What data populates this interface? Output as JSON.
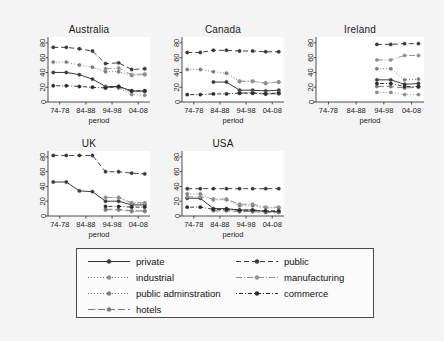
{
  "figure": {
    "background_color": "#f4f4f4",
    "panel_background": "#ffffff",
    "axis_color": "#3a3a3a",
    "xlabel": "period",
    "x_categories": [
      "74-78",
      "84-88",
      "94-98",
      "04-08"
    ],
    "x_tick_positions": [
      1.5,
      3.5,
      5.5,
      7.5
    ],
    "n_x_points": 8,
    "ylim": [
      0,
      88
    ],
    "y_ticks": [
      0,
      20,
      40,
      60,
      80
    ],
    "grid": false,
    "legend_position": "bottom-center"
  },
  "series_styles": [
    {
      "name": "private",
      "dash": "none",
      "color": "#2f2f2f",
      "marker_color": "#3d3d3d"
    },
    {
      "name": "industrial",
      "dash": "dotted",
      "color": "#8a8a8a",
      "marker_color": "#8a8a8a"
    },
    {
      "name": "public adminstration",
      "dash": "dashdot",
      "color": "#7d7d7d",
      "marker_color": "#7d7d7d"
    },
    {
      "name": "hotels",
      "dash": "longdash",
      "color": "#7a7a7a",
      "marker_color": "#7a7a7a"
    },
    {
      "name": "public",
      "dash": "dashed",
      "color": "#3a3a3a",
      "marker_color": "#3a3a3a"
    },
    {
      "name": "manufacturing",
      "dash": "dashdotdot",
      "color": "#909090",
      "marker_color": "#909090"
    },
    {
      "name": "commerce",
      "dash": "dashdotsp",
      "color": "#2b2b2b",
      "marker_color": "#2b2b2b"
    }
  ],
  "legend": {
    "entries": [
      {
        "label": "private",
        "column": 0,
        "row": 0
      },
      {
        "label": "industrial",
        "column": 0,
        "row": 1
      },
      {
        "label": "public adminstration",
        "column": 0,
        "row": 2
      },
      {
        "label": "hotels",
        "column": 0,
        "row": 3
      },
      {
        "label": "public",
        "column": 1,
        "row": 0
      },
      {
        "label": "manufacturing",
        "column": 1,
        "row": 1
      },
      {
        "label": "commerce",
        "column": 1,
        "row": 2
      }
    ]
  },
  "chart_data": {
    "type": "line",
    "title": "",
    "xlabel": "period",
    "ylabel": "",
    "ylim": [
      0,
      88
    ],
    "x": [
      1,
      2,
      3,
      4,
      5,
      6,
      7,
      8
    ],
    "x_tick_labels": [
      "74-78",
      "84-88",
      "94-98",
      "04-08"
    ],
    "legend_entries": [
      "private",
      "industrial",
      "public adminstration",
      "hotels",
      "public",
      "manufacturing",
      "commerce"
    ],
    "panels": [
      {
        "title": "Australia",
        "series": [
          {
            "name": "private",
            "values": [
              40,
              40,
              37,
              31,
              21,
              21,
              15,
              15
            ]
          },
          {
            "name": "industrial",
            "values": [
              null,
              null,
              null,
              null,
              20,
              19,
              10,
              9
            ]
          },
          {
            "name": "public adminstration",
            "values": [
              54,
              54,
              50,
              47,
              41,
              41,
              36,
              37
            ]
          },
          {
            "name": "hotels",
            "values": [
              null,
              null,
              null,
              null,
              20,
              20,
              14,
              14
            ]
          },
          {
            "name": "public",
            "values": [
              74,
              74,
              72,
              69,
              52,
              53,
              44,
              45
            ]
          },
          {
            "name": "manufacturing",
            "values": [
              null,
              null,
              null,
              null,
              45,
              46,
              37,
              38
            ]
          },
          {
            "name": "commerce",
            "values": [
              22,
              22,
              21,
              20,
              19,
              21,
              15,
              15
            ]
          }
        ]
      },
      {
        "title": "Canada",
        "series": [
          {
            "name": "private",
            "values": [
              null,
              null,
              27,
              27,
              16,
              16,
              15,
              16
            ]
          },
          {
            "name": "industrial",
            "values": [
              null,
              null,
              null,
              null,
              13,
              13,
              12,
              13
            ]
          },
          {
            "name": "public adminstration",
            "values": [
              44,
              44,
              41,
              39,
              28,
              28,
              25,
              27
            ]
          },
          {
            "name": "hotels",
            "values": [
              null,
              null,
              null,
              null,
              12,
              12,
              11,
              11
            ]
          },
          {
            "name": "public",
            "values": [
              67,
              67,
              70,
              70,
              69,
              69,
              68,
              68
            ]
          },
          {
            "name": "manufacturing",
            "values": [
              null,
              null,
              null,
              null,
              28,
              28,
              26,
              27
            ]
          },
          {
            "name": "commerce",
            "values": [
              10,
              10,
              11,
              11,
              12,
              12,
              11,
              12
            ]
          }
        ]
      },
      {
        "title": "Ireland",
        "series": [
          {
            "name": "private",
            "values": [
              null,
              null,
              null,
              null,
              30,
              30,
              24,
              25
            ]
          },
          {
            "name": "industrial",
            "values": [
              null,
              null,
              null,
              null,
              13,
              13,
              10,
              10
            ]
          },
          {
            "name": "public adminstration",
            "values": [
              null,
              null,
              null,
              null,
              45,
              45,
              30,
              31
            ]
          },
          {
            "name": "hotels",
            "values": [
              null,
              null,
              null,
              null,
              21,
              21,
              19,
              20
            ]
          },
          {
            "name": "public",
            "values": [
              null,
              null,
              null,
              null,
              78,
              78,
              79,
              79
            ]
          },
          {
            "name": "manufacturing",
            "values": [
              null,
              null,
              null,
              null,
              57,
              57,
              63,
              63
            ]
          },
          {
            "name": "commerce",
            "values": [
              null,
              null,
              null,
              null,
              25,
              25,
              21,
              21
            ]
          }
        ]
      },
      {
        "title": "UK",
        "series": [
          {
            "name": "private",
            "values": [
              46,
              46,
              34,
              33,
              20,
              20,
              15,
              15
            ]
          },
          {
            "name": "industrial",
            "values": [
              null,
              null,
              null,
              null,
              8,
              8,
              6,
              6
            ]
          },
          {
            "name": "public adminstration",
            "values": [
              null,
              null,
              null,
              null,
              25,
              25,
              17,
              17
            ]
          },
          {
            "name": "hotels",
            "values": [
              null,
              null,
              null,
              null,
              9,
              9,
              7,
              7
            ]
          },
          {
            "name": "public",
            "values": [
              82,
              82,
              82,
              82,
              60,
              60,
              58,
              57
            ]
          },
          {
            "name": "manufacturing",
            "values": [
              null,
              null,
              null,
              null,
              25,
              25,
              18,
              18
            ]
          },
          {
            "name": "commerce",
            "values": [
              null,
              null,
              null,
              null,
              13,
              13,
              12,
              12
            ]
          }
        ]
      },
      {
        "title": "USA",
        "series": [
          {
            "name": "private",
            "values": [
              24,
              24,
              10,
              10,
              8,
              8,
              6,
              6
            ]
          },
          {
            "name": "industrial",
            "values": [
              null,
              null,
              8,
              8,
              6,
              6,
              5,
              5
            ]
          },
          {
            "name": "public adminstration",
            "values": [
              30,
              30,
              22,
              22,
              14,
              14,
              11,
              11
            ]
          },
          {
            "name": "hotels",
            "values": [
              null,
              null,
              7,
              7,
              6,
              6,
              5,
              5
            ]
          },
          {
            "name": "public",
            "values": [
              37,
              37,
              37,
              37,
              37,
              37,
              37,
              37
            ]
          },
          {
            "name": "manufacturing",
            "values": [
              26,
              26,
              23,
              23,
              16,
              16,
              12,
              12
            ]
          },
          {
            "name": "commerce",
            "values": [
              12,
              12,
              9,
              9,
              8,
              8,
              7,
              7
            ]
          }
        ]
      }
    ]
  },
  "panel_layout": [
    {
      "title": "Australia",
      "left": 22,
      "top": 24,
      "width": 134,
      "height": 104
    },
    {
      "title": "Canada",
      "left": 156,
      "top": 24,
      "width": 134,
      "height": 104
    },
    {
      "title": "Ireland",
      "left": 290,
      "top": 24,
      "width": 140,
      "height": 104
    },
    {
      "title": "UK",
      "left": 22,
      "top": 138,
      "width": 134,
      "height": 104
    },
    {
      "title": "USA",
      "left": 156,
      "top": 138,
      "width": 134,
      "height": 104
    }
  ],
  "legend_layout": {
    "left": 76,
    "top": 248,
    "width": 298,
    "height": 70
  }
}
